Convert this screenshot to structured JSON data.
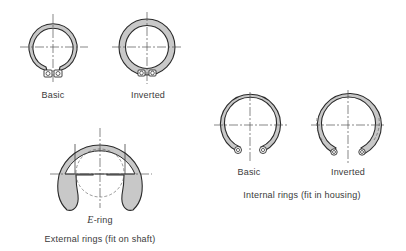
{
  "figure": {
    "colors": {
      "fill": "#c8c8c8",
      "stroke": "#2a2a2a",
      "centerline": "#555555"
    },
    "external": {
      "basic_label": "Basic",
      "inverted_label": "Inverted",
      "ering_prefix": "E",
      "ering_suffix": "-ring",
      "caption": "External rings (fit on shaft)"
    },
    "internal": {
      "basic_label": "Basic",
      "inverted_label": "Inverted",
      "caption": "Internal rings (fit in housing)"
    }
  }
}
